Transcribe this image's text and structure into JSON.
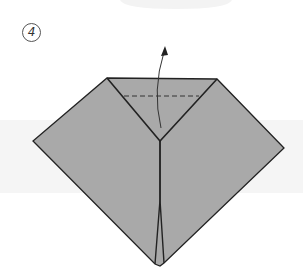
{
  "diagram": {
    "type": "origami-instruction-step",
    "step_number": "4",
    "colors": {
      "background": "#ffffff",
      "band": "#f5f5f5",
      "top_blob": "#f3f3f3",
      "paper": "#a9a9a9",
      "line": "#222222",
      "dashed": "#333333"
    },
    "elements": {
      "paper_outline": "diamond-shaped folded paper with flat top edge",
      "valley_fold_line": "dashed horizontal line across top triangle",
      "fold_arrow": "curved arrow pointing up (fold top flap upward)",
      "center_crease": "vertical split down center to bottom points"
    }
  }
}
